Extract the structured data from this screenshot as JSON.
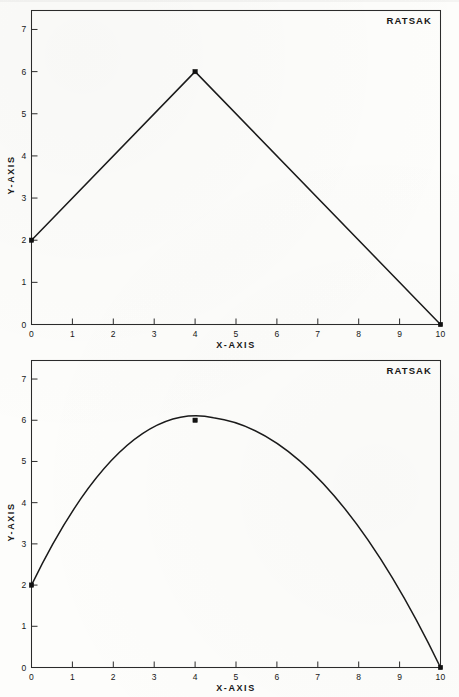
{
  "page": {
    "background_color": "#fdfdfb",
    "ink_color": "#1a1a1a"
  },
  "figures": [
    {
      "id": "figure-1",
      "corner_label": "RATSAK",
      "xlabel": "X-AXIS",
      "ylabel": "Y-AXIS"
    },
    {
      "id": "figure-2",
      "corner_label": "RATSAK",
      "xlabel": "X-AXIS",
      "ylabel": "Y-AXIS"
    }
  ],
  "chart_data": [
    {
      "type": "line",
      "title": "",
      "annotation": "RATSAK",
      "xlabel": "X-AXIS",
      "ylabel": "Y-AXIS",
      "xlim": [
        0,
        10
      ],
      "ylim": [
        0,
        7.45
      ],
      "xticks": [
        0,
        1,
        2,
        3,
        4,
        5,
        6,
        7,
        8,
        9,
        10
      ],
      "xticklabels": [
        "0",
        "1",
        "2",
        "3",
        "4",
        "5",
        "6",
        "7",
        "8",
        "9",
        "10"
      ],
      "yticks": [
        0,
        1,
        2,
        3,
        4,
        5,
        6,
        7
      ],
      "yticklabels": [
        "0",
        "1",
        "2",
        "3",
        "4",
        "5",
        "6",
        "7"
      ],
      "grid": false,
      "legend": false,
      "interpolation": "linear",
      "markers": "square",
      "series": [
        {
          "name": "RATSAK",
          "x": [
            0,
            4,
            10
          ],
          "y": [
            2,
            6,
            0
          ],
          "color": "#1a1a1a"
        }
      ]
    },
    {
      "type": "line",
      "title": "",
      "annotation": "RATSAK",
      "xlabel": "X-AXIS",
      "ylabel": "Y-AXIS",
      "xlim": [
        0,
        10
      ],
      "ylim": [
        0,
        7.45
      ],
      "xticks": [
        0,
        1,
        2,
        3,
        4,
        5,
        6,
        7,
        8,
        9,
        10
      ],
      "xticklabels": [
        "0",
        "1",
        "2",
        "3",
        "4",
        "5",
        "6",
        "7",
        "8",
        "9",
        "10"
      ],
      "yticks": [
        0,
        1,
        2,
        3,
        4,
        5,
        6,
        7
      ],
      "yticklabels": [
        "0",
        "1",
        "2",
        "3",
        "4",
        "5",
        "6",
        "7"
      ],
      "grid": false,
      "legend": false,
      "interpolation": "smooth-spline",
      "markers": "square",
      "series": [
        {
          "name": "RATSAK",
          "x": [
            0,
            4,
            10
          ],
          "y": [
            2,
            6,
            0
          ],
          "color": "#1a1a1a",
          "spline_peak": {
            "x": 4.45,
            "y": 6.06
          }
        }
      ]
    }
  ]
}
